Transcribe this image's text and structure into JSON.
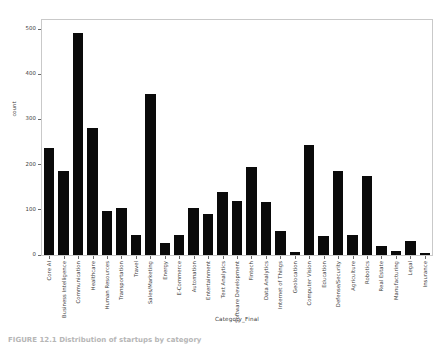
{
  "chart_data": {
    "type": "bar",
    "title": "",
    "xlabel": "Category_Final",
    "ylabel": "count",
    "ylim": [
      0,
      520
    ],
    "yticks": [
      0,
      100,
      200,
      300,
      400,
      500
    ],
    "grid": false,
    "legend": null,
    "bar_color": "#0a0a0a",
    "categories": [
      "Core AI",
      "Business Intelligence",
      "Communication",
      "Healthcare",
      "Human Resources",
      "Transportation",
      "Travel",
      "Sales/Marketing",
      "Energy",
      "E-Commerce",
      "Automation",
      "Entertainment",
      "Text Analytics",
      "Software Development",
      "Fintech",
      "Data Analytics",
      "Internet of Things",
      "Geolocation",
      "Computer Vision",
      "Education",
      "Defense/Security",
      "Agriculture",
      "Robotics",
      "Real Estate",
      "Manufacturing",
      "Legal",
      "Insurance"
    ],
    "values": [
      237,
      186,
      491,
      281,
      97,
      104,
      44,
      356,
      26,
      44,
      104,
      90,
      139,
      120,
      194,
      118,
      54,
      6,
      243,
      43,
      185,
      45,
      174,
      21,
      9,
      31,
      5
    ]
  },
  "caption": {
    "text": "FIGURE 12.1  Distribution of startups by category"
  }
}
